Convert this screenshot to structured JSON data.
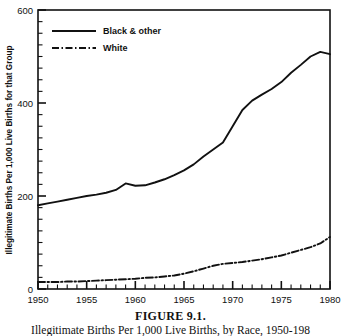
{
  "figure": {
    "caption_title": "FIGURE 9.1.",
    "caption_subtitle": "Illegitimate Births Per 1,000 Live Births, by Race, 1950-198"
  },
  "chart_data": {
    "type": "line",
    "title": "",
    "xlabel": "",
    "ylabel": "Illegitimate Births Per 1,000 Live Births for that Group",
    "xlim": [
      1950,
      1980
    ],
    "ylim": [
      0,
      600
    ],
    "x_major_ticks": [
      1950,
      1955,
      1960,
      1965,
      1970,
      1975,
      1980
    ],
    "x_major_tick_labels": [
      "1950",
      "1955",
      "1960",
      "1965",
      "1970",
      "1975",
      "1980"
    ],
    "x_minor_tick_step": 1,
    "y_major_ticks": [
      0,
      200,
      400,
      600
    ],
    "y_major_tick_labels": [
      "0",
      "200",
      "400",
      "600"
    ],
    "y_minor_tick_step": 25,
    "grid": false,
    "legend_position": "top-left",
    "x": [
      1950,
      1951,
      1952,
      1953,
      1954,
      1955,
      1956,
      1957,
      1958,
      1959,
      1960,
      1961,
      1962,
      1963,
      1964,
      1965,
      1966,
      1967,
      1968,
      1969,
      1970,
      1971,
      1972,
      1973,
      1974,
      1975,
      1976,
      1977,
      1978,
      1979,
      1980
    ],
    "series": [
      {
        "name": "Black & other",
        "style": "solid",
        "color": "#111111",
        "values": [
          180,
          184,
          188,
          192,
          196,
          200,
          203,
          207,
          213,
          227,
          222,
          223,
          229,
          236,
          245,
          255,
          268,
          285,
          300,
          315,
          350,
          385,
          405,
          418,
          430,
          445,
          465,
          482,
          500,
          510,
          505
        ]
      },
      {
        "name": "White",
        "style": "dash-dot",
        "color": "#111111",
        "values": [
          15,
          15,
          15,
          16,
          16,
          17,
          18,
          19,
          20,
          21,
          22,
          24,
          25,
          27,
          29,
          33,
          38,
          44,
          50,
          54,
          56,
          58,
          61,
          64,
          68,
          72,
          78,
          84,
          90,
          98,
          112
        ]
      }
    ]
  },
  "legend": {
    "items": [
      {
        "label": "Black & other",
        "style": "solid"
      },
      {
        "label": "White",
        "style": "dash-dot"
      }
    ]
  }
}
